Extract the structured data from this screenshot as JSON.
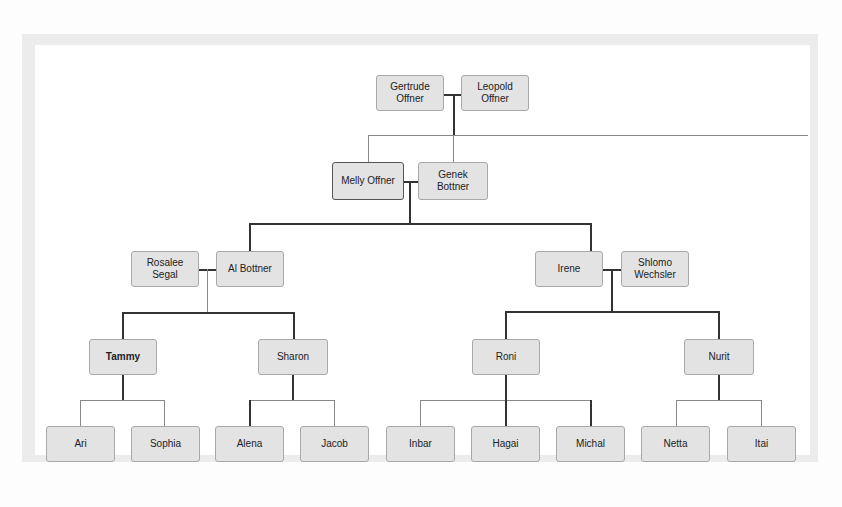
{
  "diagram": {
    "type": "family-tree",
    "generation_1": {
      "couple": [
        {
          "name": "Gertrude\nOffner"
        },
        {
          "name": "Leopold\nOffner"
        }
      ]
    },
    "generation_2": {
      "couple": [
        {
          "name": "Melly Offner"
        },
        {
          "name": "Genek\nBottner"
        }
      ]
    },
    "generation_3": [
      {
        "couple": [
          {
            "name": "Rosalee\nSegal"
          },
          {
            "name": "Al Bottner"
          }
        ],
        "children": [
          {
            "name": "Tammy",
            "children": [
              {
                "name": "Ari"
              },
              {
                "name": "Sophia"
              }
            ]
          },
          {
            "name": "Sharon",
            "children": [
              {
                "name": "Alena"
              },
              {
                "name": "Jacob"
              }
            ]
          }
        ]
      },
      {
        "couple": [
          {
            "name": "Irene"
          },
          {
            "name": "Shlomo\nWechsler"
          }
        ],
        "children": [
          {
            "name": "Roni",
            "children": [
              {
                "name": "Inbar"
              },
              {
                "name": "Hagai"
              },
              {
                "name": "Michal"
              }
            ]
          },
          {
            "name": "Nurit",
            "children": [
              {
                "name": "Netta"
              },
              {
                "name": "Itai"
              }
            ]
          }
        ]
      }
    ]
  }
}
